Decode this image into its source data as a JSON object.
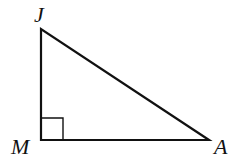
{
  "diagram": {
    "type": "right-triangle",
    "stroke_color": "#111111",
    "background": "#ffffff",
    "vertices": [
      {
        "id": "J",
        "label": "J",
        "x": 41,
        "y": 29
      },
      {
        "id": "M",
        "label": "M",
        "x": 41,
        "y": 140
      },
      {
        "id": "A",
        "label": "A",
        "x": 209,
        "y": 140
      }
    ],
    "right_angle_at": "M",
    "right_angle_marker_size": 22
  }
}
